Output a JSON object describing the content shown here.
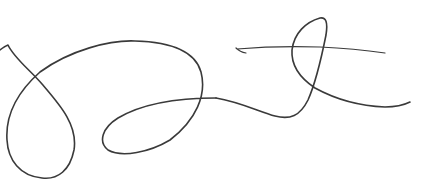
{
  "image": {
    "kind": "handwritten-signature",
    "background": "#ffffff",
    "ink_color": "#3a3a3a",
    "width": 432,
    "height": 180
  },
  "strokes": [
    {
      "name": "main-stroke",
      "d": "M 0 50 Q 5 46 8 45 C 14 58 30 70 42 84 C 60 105 78 125 74 150 C 70 170 58 180 42 178 C 20 176 8 160 7 140 C 5 110 22 88 40 72 C 70 50 110 40 135 41 C 170 42 195 50 201 72 C 207 95 196 120 170 140 C 150 152 122 158 108 150 C 98 142 102 128 118 118 C 140 105 170 98 216 98",
      "width": 1.6
    },
    {
      "name": "tail-stroke",
      "d": "M 216 98 C 240 102 260 112 275 116 C 290 120 300 116 308 100 C 316 82 322 55 326 35 C 328 22 326 17 320 18 C 306 22 294 33 292 50 C 291 65 300 78 315 88 C 335 99 360 106 385 107 C 398 107 406 104 410 102",
      "width": 1.6
    },
    {
      "name": "crossbar-stroke",
      "d": "M 236 48 Q 240 52 246 53 M 237 49 C 260 47 290 46 320 47 C 345 48 365 50 385 53",
      "width": 1.2
    }
  ]
}
